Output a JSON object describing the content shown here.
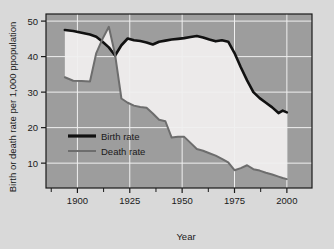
{
  "figure": {
    "outer_background": "#d9d9d9",
    "plot_background": "#9d9d9d",
    "between_fill": "#eceaea",
    "grid_color": "#f0f0f0",
    "frame_color": "#1a1a1a"
  },
  "chart_data": {
    "type": "line",
    "title": "",
    "xlabel": "Year",
    "ylabel": "Birth or death rate per 1,000 ppopulation",
    "xlim": [
      1885,
      2012
    ],
    "ylim": [
      3,
      52
    ],
    "xticks": [
      1900,
      1925,
      1950,
      1975,
      2000
    ],
    "xtick_labels": [
      "1900",
      "1925",
      "1950",
      "1975",
      "2000"
    ],
    "xticks_minor": [
      1887.5,
      1912.5,
      1937.5,
      1962.5,
      1987.5
    ],
    "yticks": [
      10,
      20,
      30,
      40,
      50
    ],
    "ytick_labels": [
      "10",
      "20",
      "30",
      "40",
      "50"
    ],
    "grid": true,
    "grid_axis": "both",
    "legend_position": "center-left",
    "series": [
      {
        "name": "Birth rate",
        "color": "#111111",
        "width": 2.6,
        "x": [
          1894,
          1898,
          1902,
          1906,
          1909,
          1912,
          1915,
          1918,
          1921,
          1924,
          1927,
          1930,
          1933,
          1936,
          1939,
          1942,
          1945,
          1948,
          1951,
          1954,
          1957,
          1960,
          1963,
          1966,
          1969,
          1972,
          1975,
          1978,
          1981,
          1984,
          1987,
          1990,
          1993,
          1996,
          1998,
          2000
        ],
        "y": [
          47.5,
          47.2,
          46.7,
          46.2,
          45.6,
          44.2,
          42.6,
          40.3,
          43.2,
          45.1,
          44.6,
          44.4,
          44.0,
          43.4,
          44.2,
          44.5,
          44.8,
          45.0,
          45.2,
          45.5,
          45.8,
          45.4,
          44.8,
          44.3,
          44.6,
          44.2,
          41.0,
          37.0,
          33.3,
          30.0,
          28.3,
          27.0,
          25.7,
          24.1,
          24.8,
          24.3
        ]
      },
      {
        "name": "Death rate",
        "color": "#6d6d6d",
        "width": 2.0,
        "x": [
          1894,
          1898,
          1902,
          1906,
          1909,
          1912,
          1915,
          1918,
          1921,
          1924,
          1927,
          1930,
          1933,
          1936,
          1939,
          1942,
          1945,
          1948,
          1951,
          1954,
          1957,
          1960,
          1963,
          1966,
          1969,
          1972,
          1975,
          1978,
          1981,
          1984,
          1987,
          1990,
          1993,
          1996,
          1998,
          2000
        ],
        "y": [
          34.2,
          33.2,
          33.1,
          33.0,
          41.0,
          45.0,
          48.4,
          40.5,
          28.2,
          27.0,
          26.2,
          25.8,
          25.6,
          24.0,
          22.2,
          21.8,
          17.2,
          17.4,
          17.4,
          15.7,
          14.0,
          13.5,
          12.8,
          12.1,
          11.2,
          10.2,
          8.0,
          8.6,
          9.4,
          8.3,
          7.9,
          7.3,
          6.8,
          6.2,
          5.8,
          5.5
        ]
      }
    ],
    "annotations": []
  },
  "legend": {
    "items": [
      {
        "label": "Birth rate",
        "color": "#111111",
        "width": 3.2
      },
      {
        "label": "Death rate",
        "color": "#6d6d6d",
        "width": 2.0
      }
    ]
  }
}
